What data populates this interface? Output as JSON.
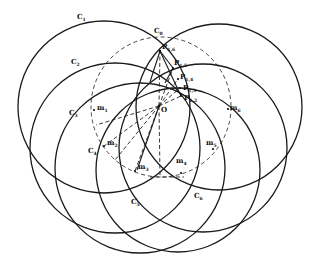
{
  "figure": {
    "type": "geometric-construction",
    "width": 317,
    "height": 267,
    "stroke_color": "#1a1a1a",
    "background": "#ffffff"
  },
  "labels": {
    "C0": {
      "main": "C",
      "sub": "0"
    },
    "C1": {
      "main": "C",
      "sub": "1"
    },
    "C2": {
      "main": "C",
      "sub": "2"
    },
    "C3": {
      "main": "C",
      "sub": "3"
    },
    "C4": {
      "main": "C",
      "sub": "4"
    },
    "C5": {
      "main": "C",
      "sub": "5"
    },
    "C6": {
      "main": "C",
      "sub": "6"
    },
    "O": {
      "main": "O",
      "sub": ""
    },
    "m1": {
      "main": "m",
      "sub": "1"
    },
    "m2": {
      "main": "m",
      "sub": "2"
    },
    "m3": {
      "main": "m",
      "sub": "3"
    },
    "m4": {
      "main": "m",
      "sub": "4"
    },
    "m5": {
      "main": "m",
      "sub": "5"
    },
    "m6": {
      "main": "m",
      "sub": "6"
    },
    "P12": {
      "main": "P",
      "sub": "1,2"
    },
    "P13": {
      "main": "P",
      "sub": "1,3"
    },
    "P14": {
      "main": "P",
      "sub": "1,4"
    },
    "P15": {
      "main": "P",
      "sub": "1,5"
    },
    "P16": {
      "main": "P",
      "sub": "1,6"
    }
  },
  "geometry": {
    "circles": [
      {
        "id": "C0",
        "cx": 161,
        "cy": 107,
        "r": 70,
        "style": "dashed"
      },
      {
        "id": "C1",
        "cx": 104,
        "cy": 107,
        "r": 86,
        "style": "solid"
      },
      {
        "id": "C2",
        "cx": 115,
        "cy": 148,
        "r": 85,
        "style": "solid"
      },
      {
        "id": "C3",
        "cx": 140,
        "cy": 168,
        "r": 85,
        "style": "solid"
      },
      {
        "id": "C4",
        "cx": 178,
        "cy": 170,
        "r": 82,
        "style": "solid"
      },
      {
        "id": "C5",
        "cx": 203,
        "cy": 148,
        "r": 84,
        "style": "solid"
      },
      {
        "id": "C6",
        "cx": 219,
        "cy": 107,
        "r": 83,
        "style": "solid"
      }
    ],
    "O": [
      159,
      106
    ],
    "points": {
      "P16": [
        160,
        51
      ],
      "P15": [
        173,
        68
      ],
      "P14": [
        178,
        79
      ],
      "P13": [
        180,
        88
      ],
      "P12": [
        181,
        96
      ],
      "m1": [
        94,
        110
      ],
      "m2": [
        104,
        146
      ],
      "m3": [
        135,
        171
      ],
      "m4": [
        181,
        173
      ],
      "m5": [
        213,
        149
      ],
      "m6": [
        228,
        109
      ]
    }
  }
}
